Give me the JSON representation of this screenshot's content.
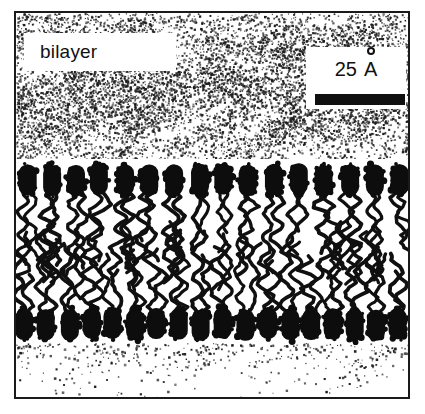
{
  "figure": {
    "label": "bilayer",
    "scale": {
      "value": "25",
      "unit": "A",
      "unit_full": "angstrom",
      "bar_length_px": 90
    },
    "border_color": "#1a1a1a",
    "ink_color": "#101010",
    "background_color": "#ffffff",
    "caption_alt": "Schematic cross-section of a phospholipid bilayer showing two opposed leaflets of dark ovoid head groups with disordered hydrocarbon tails between them, surrounded by stippled aqueous regions."
  },
  "chart_data": {
    "type": "diagram",
    "title": "bilayer",
    "structure": "lipid-bilayer-cross-section",
    "leaflets": [
      {
        "name": "upper-leaflet",
        "head_count": 16,
        "head_row_y": 158,
        "orientation": "heads-up-tails-down"
      },
      {
        "name": "lower-leaflet",
        "head_count": 18,
        "head_row_y": 305,
        "orientation": "heads-down-tails-up"
      }
    ],
    "regions": [
      {
        "name": "aqueous-upper",
        "style": "stipple",
        "y_range": [
          11,
          157
        ]
      },
      {
        "name": "hydrocarbon-core",
        "style": "squiggly-chains",
        "y_range": [
          200,
          305
        ]
      },
      {
        "name": "aqueous-lower",
        "style": "sparse-stipple",
        "y_range": [
          345,
          399
        ]
      }
    ],
    "scale_bar": {
      "label": "25 A",
      "value": 25,
      "unit": "angstrom"
    },
    "annotations": [
      {
        "text": "bilayer",
        "x": 24,
        "y": 26
      },
      {
        "text": "25 A",
        "x": 292,
        "y": 44
      }
    ]
  }
}
